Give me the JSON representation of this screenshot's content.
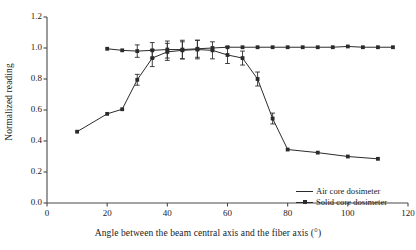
{
  "chart_data": {
    "type": "line",
    "title": "",
    "xlabel": "Angle between the beam central axis and the fiber axis (°)",
    "ylabel": "Normalized reading",
    "xlim": [
      0,
      120
    ],
    "ylim": [
      0.0,
      1.2
    ],
    "xticks": [
      0,
      20,
      40,
      60,
      80,
      100,
      120
    ],
    "yticks": [
      "0.0",
      "0.2",
      "0.4",
      "0.6",
      "0.8",
      "1.0",
      "1.2"
    ],
    "grid": false,
    "legend_position": "lower-right",
    "series": [
      {
        "name": "Air core dosimeter",
        "marker": "square",
        "color": "#2b2b2b",
        "x": [
          10,
          20,
          25,
          30,
          35,
          40,
          45,
          50,
          55,
          60,
          65,
          70,
          75,
          80,
          90,
          100,
          110
        ],
        "y": [
          0.46,
          0.575,
          0.605,
          0.795,
          0.935,
          0.975,
          0.985,
          0.99,
          0.985,
          0.955,
          0.935,
          0.8,
          0.545,
          0.345,
          0.325,
          0.3,
          0.285
        ],
        "yerr": [
          0.0,
          0.0,
          0.0,
          0.035,
          0.055,
          0.055,
          0.055,
          0.06,
          0.055,
          0.055,
          0.045,
          0.045,
          0.035,
          0.0,
          0.0,
          0.0,
          0.0
        ]
      },
      {
        "name": "Solid core dosimeter",
        "marker": "square",
        "color": "#2b2b2b",
        "x": [
          20,
          25,
          30,
          35,
          40,
          45,
          50,
          55,
          60,
          65,
          70,
          75,
          80,
          85,
          90,
          95,
          100,
          105,
          110,
          115
        ],
        "y": [
          0.995,
          0.985,
          0.98,
          0.985,
          0.99,
          0.99,
          0.995,
          1.0,
          1.005,
          1.005,
          1.005,
          1.005,
          1.005,
          1.005,
          1.005,
          1.005,
          1.01,
          1.005,
          1.005,
          1.005
        ],
        "yerr": [
          0.0,
          0.0,
          0.04,
          0.05,
          0.055,
          0.06,
          0.055,
          0.0,
          0.0,
          0.0,
          0.0,
          0.0,
          0.0,
          0.0,
          0.0,
          0.0,
          0.0,
          0.0,
          0.0,
          0.0
        ]
      }
    ]
  },
  "axes": {
    "ylabel": "Normalized reading",
    "xlabel": "Angle between the beam central axis and the fiber axis (°)"
  },
  "legend": {
    "items": [
      {
        "label": "Air core dosimeter",
        "marker": "line"
      },
      {
        "label": "Solid core dosimeter",
        "marker": "line-square"
      }
    ]
  },
  "colors": {
    "axis": "#4a4a4a",
    "data": "#2b2b2b",
    "text": "#1a1a1a",
    "background": "#ffffff"
  }
}
